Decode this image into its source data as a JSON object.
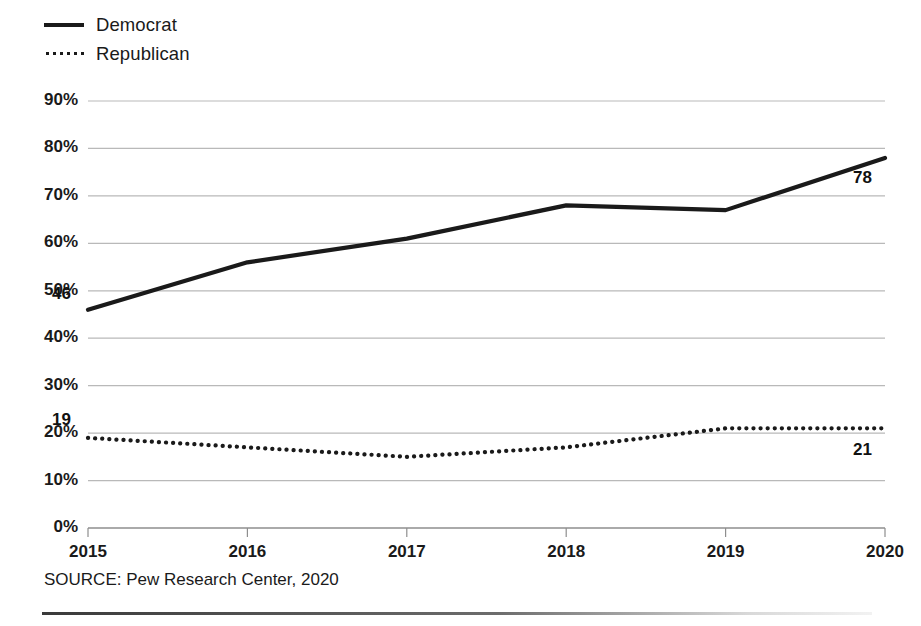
{
  "legend": {
    "items": [
      {
        "label": "Democrat",
        "style": "solid",
        "icon": "solid-line-icon",
        "color": "#1a1a1a"
      },
      {
        "label": "Republican",
        "style": "dotted",
        "icon": "dotted-line-icon",
        "color": "#1a1a1a"
      }
    ]
  },
  "source": {
    "text": "SOURCE: Pew Research Center, 2020"
  },
  "chart_data": {
    "type": "line",
    "title": "",
    "subtitle": "",
    "xlabel": "",
    "ylabel": "",
    "categories": [
      "2015",
      "2016",
      "2017",
      "2018",
      "2019",
      "2020"
    ],
    "x": [
      2015,
      2016,
      2017,
      2018,
      2019,
      2020
    ],
    "ylim": [
      0,
      90
    ],
    "yticks": [
      0,
      10,
      20,
      30,
      40,
      50,
      60,
      70,
      80,
      90
    ],
    "ytick_labels": [
      "0%",
      "10%",
      "20%",
      "30%",
      "40%",
      "50%",
      "60%",
      "70%",
      "80%",
      "90%"
    ],
    "xtick_labels": [
      "2015",
      "2016",
      "2017",
      "2018",
      "2019",
      "2020"
    ],
    "grid": true,
    "grid_axis": "y",
    "legend_position": "top-left",
    "series": [
      {
        "name": "Democrat",
        "style": "solid",
        "color": "#1a1a1a",
        "values": [
          46,
          56,
          61,
          68,
          67,
          78
        ],
        "endpoint_labels": {
          "first": "46",
          "last": "78"
        }
      },
      {
        "name": "Republican",
        "style": "dotted",
        "color": "#1a1a1a",
        "values": [
          19,
          17,
          15,
          17,
          21,
          21
        ],
        "endpoint_labels": {
          "first": "19",
          "last": "21"
        }
      }
    ],
    "annotations": [
      {
        "name": "democrat-start-label",
        "text": "46",
        "series": "Democrat",
        "x": 2015,
        "y": 46
      },
      {
        "name": "democrat-end-label",
        "text": "78",
        "series": "Democrat",
        "x": 2020,
        "y": 78
      },
      {
        "name": "republican-start-label",
        "text": "19",
        "series": "Republican",
        "x": 2015,
        "y": 19
      },
      {
        "name": "republican-end-label",
        "text": "21",
        "series": "Republican",
        "x": 2020,
        "y": 21
      }
    ]
  }
}
